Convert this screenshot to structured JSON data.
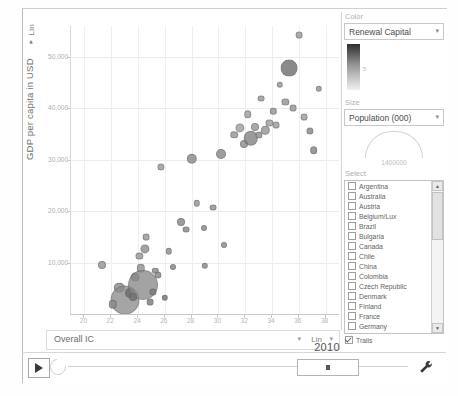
{
  "app": {
    "title": "Bubble Chart Explorer"
  },
  "y_axis": {
    "scale_label": "Lin",
    "scale_caret": "▾",
    "menu_caret": "▾",
    "title": "GDP per capita in USD",
    "ticks": [
      "50,000",
      "40,000",
      "30,000",
      "20,000",
      "10,000"
    ]
  },
  "x_axis": {
    "indicator": "Overall IC",
    "indicator_caret": "▾",
    "scale_label": "Lin",
    "scale_caret": "▾",
    "ticks": [
      "20",
      "22",
      "24",
      "26",
      "28",
      "30",
      "32",
      "34",
      "36",
      "38"
    ]
  },
  "panel": {
    "color": {
      "group_label": "Color",
      "value": "Renewal Capital",
      "caret": "▾",
      "gradient_tick": "5",
      "gradient_from": "#2f2f2f",
      "gradient_to": "#efefef"
    },
    "size": {
      "group_label": "Size",
      "value": "Population (000)",
      "caret": "▾",
      "max_value": "1400000"
    },
    "select": {
      "group_label": "Select",
      "scroll_up": "▲",
      "scroll_down": "▼",
      "countries": [
        {
          "label": "Argentina",
          "checked": false
        },
        {
          "label": "Australia",
          "checked": false
        },
        {
          "label": "Austria",
          "checked": false
        },
        {
          "label": "Belgium/Lux",
          "checked": false
        },
        {
          "label": "Brazil",
          "checked": false
        },
        {
          "label": "Bulgaria",
          "checked": false
        },
        {
          "label": "Canada",
          "checked": false
        },
        {
          "label": "Chile",
          "checked": false
        },
        {
          "label": "China",
          "checked": false
        },
        {
          "label": "Colombia",
          "checked": false
        },
        {
          "label": "Czech Republic",
          "checked": false
        },
        {
          "label": "Denmark",
          "checked": false
        },
        {
          "label": "Finland",
          "checked": false
        },
        {
          "label": "France",
          "checked": false
        },
        {
          "label": "Germany",
          "checked": false
        }
      ],
      "trails": {
        "label": "Trails",
        "checked": true
      }
    }
  },
  "timeline": {
    "play_label": "▶",
    "year": "2010",
    "settings_icon": "wrench-icon",
    "loop_icon": "loop-icon"
  },
  "chart_data": {
    "type": "scatter",
    "title": "",
    "xlabel": "Overall IC",
    "ylabel": "GDP per capita in USD",
    "xlim": [
      19,
      39
    ],
    "ylim": [
      0,
      56000
    ],
    "xscale": "Lin",
    "yscale": "Lin",
    "grid": true,
    "legend": "none",
    "size_encoding": "Population (000)",
    "color_encoding": "Renewal Capital",
    "xticks": [
      20,
      22,
      24,
      26,
      28,
      30,
      32,
      34,
      36,
      38
    ],
    "yticks": [
      10000,
      20000,
      30000,
      40000,
      50000
    ],
    "points": [
      {
        "x": 21.3,
        "y": 9600,
        "r": 3.0,
        "c": "#9a9a9a"
      },
      {
        "x": 22.6,
        "y": 5100,
        "r": 4.2,
        "c": "#8f8f8f"
      },
      {
        "x": 23.0,
        "y": 2700,
        "r": 13.5,
        "c": "#8c8c8c"
      },
      {
        "x": 23.4,
        "y": 4100,
        "r": 4.0,
        "c": "#6e6e6e"
      },
      {
        "x": 23.8,
        "y": 7200,
        "r": 3.4,
        "c": "#888888"
      },
      {
        "x": 24.1,
        "y": 11300,
        "r": 2.6,
        "c": "#9a9a9a"
      },
      {
        "x": 24.2,
        "y": 8900,
        "r": 3.2,
        "c": "#979797"
      },
      {
        "x": 24.4,
        "y": 5600,
        "r": 14.0,
        "c": "#8a8a8a"
      },
      {
        "x": 24.5,
        "y": 12600,
        "r": 3.6,
        "c": "#949494"
      },
      {
        "x": 24.6,
        "y": 14900,
        "r": 2.4,
        "c": "#9c9c9c"
      },
      {
        "x": 25.1,
        "y": 4300,
        "r": 2.6,
        "c": "#7d7d7d"
      },
      {
        "x": 25.3,
        "y": 8400,
        "r": 2.2,
        "c": "#8e8e8e"
      },
      {
        "x": 25.5,
        "y": 7600,
        "r": 2.6,
        "c": "#8a8a8a"
      },
      {
        "x": 25.7,
        "y": 28600,
        "r": 2.6,
        "c": "#9e9e9e"
      },
      {
        "x": 26.0,
        "y": 3100,
        "r": 2.2,
        "c": "#7a7a7a"
      },
      {
        "x": 26.3,
        "y": 12200,
        "r": 2.2,
        "c": "#949494"
      },
      {
        "x": 27.2,
        "y": 17900,
        "r": 3.0,
        "c": "#8d8d8d"
      },
      {
        "x": 27.6,
        "y": 16400,
        "r": 2.4,
        "c": "#8d8d8d"
      },
      {
        "x": 28.0,
        "y": 30200,
        "r": 4.2,
        "c": "#8f8f8f"
      },
      {
        "x": 28.4,
        "y": 21500,
        "r": 2.2,
        "c": "#9a9a9a"
      },
      {
        "x": 28.9,
        "y": 16800,
        "r": 2.0,
        "c": "#8f8f8f"
      },
      {
        "x": 29.6,
        "y": 20700,
        "r": 2.4,
        "c": "#939393"
      },
      {
        "x": 30.2,
        "y": 31200,
        "r": 4.0,
        "c": "#8d8d8d"
      },
      {
        "x": 30.4,
        "y": 13400,
        "r": 2.0,
        "c": "#909090"
      },
      {
        "x": 31.2,
        "y": 34900,
        "r": 2.8,
        "c": "#9b9b9b"
      },
      {
        "x": 31.6,
        "y": 36200,
        "r": 3.6,
        "c": "#a4a4a4"
      },
      {
        "x": 31.9,
        "y": 33100,
        "r": 3.0,
        "c": "#949494"
      },
      {
        "x": 32.2,
        "y": 38900,
        "r": 2.8,
        "c": "#a0a0a0"
      },
      {
        "x": 32.4,
        "y": 34200,
        "r": 6.2,
        "c": "#7f7f7f"
      },
      {
        "x": 32.7,
        "y": 36400,
        "r": 3.0,
        "c": "#9d9d9d"
      },
      {
        "x": 33.0,
        "y": 34800,
        "r": 2.6,
        "c": "#959595"
      },
      {
        "x": 33.2,
        "y": 41900,
        "r": 2.4,
        "c": "#9c9c9c"
      },
      {
        "x": 33.5,
        "y": 35700,
        "r": 3.2,
        "c": "#9a9a9a"
      },
      {
        "x": 33.8,
        "y": 37100,
        "r": 2.6,
        "c": "#a1a1a1"
      },
      {
        "x": 34.1,
        "y": 39400,
        "r": 2.2,
        "c": "#9b9b9b"
      },
      {
        "x": 34.3,
        "y": 36800,
        "r": 2.4,
        "c": "#9e9e9e"
      },
      {
        "x": 34.6,
        "y": 44600,
        "r": 2.2,
        "c": "#9d9d9d"
      },
      {
        "x": 35.0,
        "y": 41200,
        "r": 2.6,
        "c": "#989898"
      },
      {
        "x": 35.3,
        "y": 47800,
        "r": 7.4,
        "c": "#6a6a6a"
      },
      {
        "x": 35.6,
        "y": 40100,
        "r": 2.4,
        "c": "#9a9a9a"
      },
      {
        "x": 36.0,
        "y": 54200,
        "r": 2.4,
        "c": "#9f9f9f"
      },
      {
        "x": 36.4,
        "y": 38300,
        "r": 2.4,
        "c": "#a0a0a0"
      },
      {
        "x": 36.8,
        "y": 35600,
        "r": 2.6,
        "c": "#8e8e8e"
      },
      {
        "x": 37.1,
        "y": 31900,
        "r": 2.8,
        "c": "#8a8a8a"
      },
      {
        "x": 37.5,
        "y": 43800,
        "r": 2.2,
        "c": "#9c9c9c"
      },
      {
        "x": 22.1,
        "y": 1900,
        "r": 3.2,
        "c": "#8b8b8b"
      },
      {
        "x": 23.6,
        "y": 3300,
        "r": 3.0,
        "c": "#757575"
      },
      {
        "x": 24.9,
        "y": 2300,
        "r": 2.4,
        "c": "#828282"
      },
      {
        "x": 26.6,
        "y": 9100,
        "r": 2.0,
        "c": "#8d8d8d"
      },
      {
        "x": 29.0,
        "y": 9400,
        "r": 2.2,
        "c": "#8f8f8f"
      }
    ]
  }
}
